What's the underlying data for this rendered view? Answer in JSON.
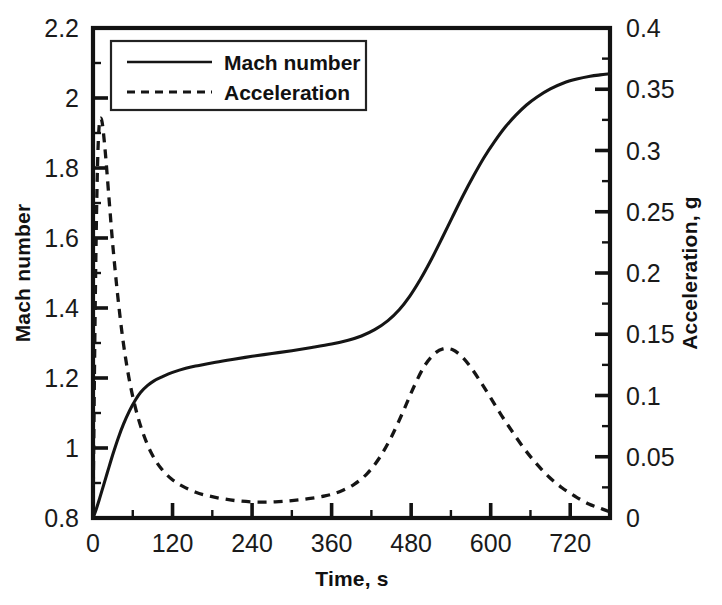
{
  "chart_data": {
    "type": "line",
    "title": "",
    "xlabel": "Time, s",
    "ylabel": "Mach number",
    "y2label": "Acceleration, g",
    "xlim": [
      0,
      780
    ],
    "ylim": [
      0.8,
      2.2
    ],
    "y2lim": [
      0,
      0.4
    ],
    "grid": false,
    "legend_position": "top-left-inside",
    "x_ticks": [
      0,
      120,
      240,
      360,
      480,
      600,
      720
    ],
    "x_tick_labels": [
      "0",
      "120",
      "240",
      "360",
      "480",
      "600",
      "720"
    ],
    "x_minor_step": 60,
    "y_ticks": [
      0.8,
      1.0,
      1.2,
      1.4,
      1.6,
      1.8,
      2.0,
      2.2
    ],
    "y_tick_labels": [
      "0.8",
      "1",
      "1.2",
      "1.4",
      "1.6",
      "1.8",
      "2",
      "2.2"
    ],
    "y_minor_step": 0.1,
    "y2_ticks": [
      0,
      0.05,
      0.1,
      0.15,
      0.2,
      0.25,
      0.3,
      0.35,
      0.4
    ],
    "y2_tick_labels": [
      "0",
      "0.05",
      "0.1",
      "0.15",
      "0.2",
      "0.25",
      "0.3",
      "0.35",
      "0.4"
    ],
    "y2_minor_step": 0.025,
    "series": [
      {
        "name": "Mach number",
        "axis": "left",
        "style": "solid",
        "color": "#151515",
        "x": [
          0,
          5,
          10,
          16,
          22,
          30,
          38,
          46,
          55,
          64,
          72,
          82,
          92,
          105,
          120,
          140,
          160,
          185,
          210,
          240,
          270,
          300,
          330,
          360,
          385,
          405,
          425,
          445,
          462,
          478,
          494,
          510,
          526,
          542,
          558,
          574,
          590,
          606,
          622,
          638,
          654,
          670,
          690,
          710,
          730,
          750,
          765,
          780
        ],
        "y": [
          0.8,
          0.826,
          0.856,
          0.894,
          0.932,
          0.982,
          1.028,
          1.068,
          1.106,
          1.137,
          1.159,
          1.178,
          1.192,
          1.204,
          1.216,
          1.228,
          1.236,
          1.245,
          1.253,
          1.262,
          1.27,
          1.278,
          1.287,
          1.297,
          1.308,
          1.32,
          1.338,
          1.364,
          1.395,
          1.434,
          1.482,
          1.537,
          1.597,
          1.659,
          1.72,
          1.777,
          1.83,
          1.876,
          1.917,
          1.951,
          1.98,
          2.003,
          2.026,
          2.043,
          2.054,
          2.062,
          2.066,
          2.069
        ]
      },
      {
        "name": "Acceleration",
        "axis": "right",
        "style": "dashed",
        "color": "#151515",
        "x": [
          0,
          3,
          6,
          9,
          13,
          18,
          24,
          30,
          37,
          45,
          54,
          64,
          75,
          88,
          102,
          118,
          135,
          155,
          175,
          198,
          222,
          248,
          275,
          300,
          325,
          350,
          372,
          394,
          414,
          432,
          450,
          468,
          484,
          500,
          515,
          528,
          542,
          556,
          570,
          585,
          600,
          616,
          632,
          650,
          668,
          688,
          708,
          728,
          748,
          765,
          780
        ],
        "y": [
          0.0,
          0.158,
          0.268,
          0.318,
          0.325,
          0.302,
          0.262,
          0.222,
          0.183,
          0.146,
          0.115,
          0.09,
          0.07,
          0.053,
          0.041,
          0.032,
          0.026,
          0.021,
          0.018,
          0.0155,
          0.0138,
          0.013,
          0.0132,
          0.0142,
          0.0158,
          0.018,
          0.0215,
          0.0275,
          0.0365,
          0.049,
          0.066,
          0.087,
          0.107,
          0.124,
          0.134,
          0.138,
          0.1375,
          0.132,
          0.123,
          0.111,
          0.098,
          0.084,
          0.071,
          0.057,
          0.045,
          0.0335,
          0.0245,
          0.0175,
          0.0115,
          0.008,
          0.005
        ]
      }
    ]
  },
  "legend": {
    "entries": [
      {
        "label": "Mach number",
        "style": "solid"
      },
      {
        "label": "Acceleration",
        "style": "dashed"
      }
    ]
  },
  "axes": {
    "left_title": "Mach number",
    "right_title": "Acceleration, g",
    "bottom_title": "Time, s"
  },
  "colors": {
    "ink": "#151515",
    "frame": "#121212",
    "background": "#ffffff"
  }
}
